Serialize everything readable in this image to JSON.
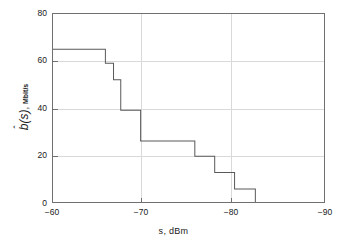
{
  "chart_data": {
    "type": "line",
    "subtype": "step-post",
    "title": "",
    "xlabel": "s, dBm",
    "ylabel": "b̂(s), Mbit/s",
    "ylabel_symbol": "b",
    "ylabel_arg": "(s)",
    "ylabel_unit": "Mbit/s",
    "ylabel_comma": ",",
    "xlim": [
      -60,
      -90
    ],
    "ylim": [
      0,
      80
    ],
    "x_ticks": [
      -60,
      -70,
      -80,
      -90
    ],
    "x_tick_labels": [
      "−60",
      "−70",
      "−80",
      "−90"
    ],
    "y_ticks": [
      0,
      20,
      40,
      60,
      80
    ],
    "y_tick_labels": [
      "0",
      "20",
      "40",
      "60",
      "80"
    ],
    "grid": true,
    "grid_color": "#d9d9d9",
    "axis_color": "#707070",
    "line_color": "#595959",
    "background": "#ffffff",
    "legend": null,
    "x": [
      -60.0,
      -65.8,
      -66.7,
      -67.5,
      -69.7,
      -75.7,
      -77.9,
      -80.1,
      -82.4
    ],
    "values": [
      65,
      59,
      52,
      39,
      26,
      19.5,
      12.5,
      5.5,
      0
    ],
    "steps": [
      {
        "x_start": -60.0,
        "x_end": -65.8,
        "y": 65
      },
      {
        "x_start": -65.8,
        "x_end": -66.7,
        "y": 59
      },
      {
        "x_start": -66.7,
        "x_end": -67.5,
        "y": 52
      },
      {
        "x_start": -67.5,
        "x_end": -69.7,
        "y": 39
      },
      {
        "x_start": -69.7,
        "x_end": -75.7,
        "y": 26
      },
      {
        "x_start": -75.7,
        "x_end": -77.9,
        "y": 19.5
      },
      {
        "x_start": -77.9,
        "x_end": -80.1,
        "y": 12.5
      },
      {
        "x_start": -80.1,
        "x_end": -82.4,
        "y": 5.5
      },
      {
        "x_start": -82.4,
        "x_end": -82.4,
        "y": 0
      }
    ]
  }
}
